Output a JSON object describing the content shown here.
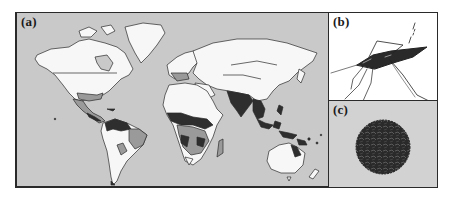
{
  "figure": {
    "panels": [
      {
        "id": "a",
        "label": "(a)",
        "content": "world-distribution-map",
        "shading_levels": [
          "white",
          "light-gray",
          "dark-gray"
        ]
      },
      {
        "id": "b",
        "label": "(b)",
        "content": "mosquito-illustration"
      },
      {
        "id": "c",
        "label": "(c)",
        "content": "virus-particle-micrograph"
      }
    ],
    "colors": {
      "ocean": "#c9c9c9",
      "land_unaffected": "#f7f7f7",
      "land_moderate": "#9a9a9a",
      "land_high": "#2e2e2e",
      "border": "#2a2a2a",
      "panel_c_bg": "#d2d2d2"
    }
  }
}
